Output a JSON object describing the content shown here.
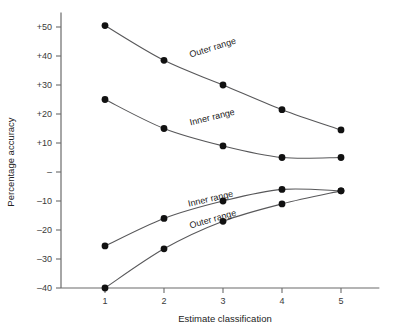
{
  "chart_data": {
    "type": "line",
    "title": "",
    "subtitle": "",
    "xlabel": "Estimate classification",
    "ylabel": "Percentage accuracy",
    "x": [
      1,
      2,
      3,
      4,
      5
    ],
    "xtick_labels": [
      "1",
      "2",
      "3",
      "4",
      "5"
    ],
    "ytick_values": [
      50,
      40,
      30,
      20,
      10,
      0,
      -10,
      -20,
      -30,
      -40
    ],
    "ytick_labels": [
      "+50",
      "+40",
      "+30",
      "+20",
      "+10",
      "–",
      "–10",
      "–20",
      "–30",
      "–40"
    ],
    "xlim": [
      0.45,
      5.65
    ],
    "ylim": [
      -40,
      55
    ],
    "grid": false,
    "legend": "inline-curve-labels",
    "series": [
      {
        "name": "Outer range",
        "label": "Outer range",
        "position": "upper",
        "label_anchor_x": 2.45,
        "label_anchor_y": 39.5,
        "label_rotation": -17,
        "values": [
          50.5,
          38.5,
          30.0,
          21.5,
          14.5
        ]
      },
      {
        "name": "Inner range",
        "label": "Inner range",
        "position": "upper",
        "label_anchor_x": 2.45,
        "label_anchor_y": 16.0,
        "label_rotation": -14,
        "values": [
          25.0,
          15.0,
          9.0,
          5.0,
          5.0
        ]
      },
      {
        "name": "Inner range",
        "label": "Inner range",
        "position": "lower",
        "label_anchor_x": 2.42,
        "label_anchor_y": -12.0,
        "label_rotation": -13,
        "values": [
          -25.5,
          -16.0,
          -10.0,
          -6.0,
          -6.5
        ]
      },
      {
        "name": "Outer range",
        "label": "Outer range",
        "position": "lower",
        "label_anchor_x": 2.45,
        "label_anchor_y": -19.5,
        "label_rotation": -16,
        "values": [
          -40.0,
          -26.5,
          -17.0,
          -11.0,
          -6.5
        ]
      }
    ],
    "colors": {
      "curve": "#58585a",
      "point": "#111111",
      "axis": "#6b6b6b",
      "text": "#222222",
      "background": "#ffffff"
    }
  }
}
